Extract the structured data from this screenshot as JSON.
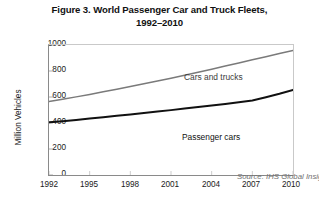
{
  "title": {
    "line1": "Figure 3. World Passenger Car and Truck Fleets,",
    "line2": "1992–2010"
  },
  "source_note": "Source: IHS Global Insight",
  "annotations": {
    "cars_and_trucks": "Cars and trucks",
    "passenger_cars": "Passenger cars"
  },
  "colors": {
    "cars_and_trucks_line": "#7a7a7a",
    "passenger_cars_line": "#111111",
    "axis": "#8a8a8a",
    "background": "#ffffff",
    "text": "#1a1a1a",
    "source_text": "#707070"
  },
  "chart_data": {
    "type": "line",
    "title": "Figure 3. World Passenger Car and Truck Fleets, 1992–2010",
    "xlabel": "",
    "ylabel": "Million Vehicles",
    "xlim": [
      1992,
      2010
    ],
    "ylim": [
      0,
      1000
    ],
    "xticks": [
      1992,
      1995,
      1998,
      2001,
      2004,
      2007,
      2010
    ],
    "yticks": [
      0,
      200,
      400,
      600,
      800,
      1000
    ],
    "grid": false,
    "legend": "inline-annotations",
    "x": [
      1992,
      1993,
      1994,
      1995,
      1996,
      1997,
      1998,
      1999,
      2000,
      2001,
      2002,
      2003,
      2004,
      2005,
      2006,
      2007,
      2008,
      2009,
      2010
    ],
    "series": [
      {
        "name": "Cars and trucks",
        "color": "#7a7a7a",
        "values": [
          565,
          583,
          601,
          620,
          640,
          660,
          681,
          702,
          723,
          745,
          768,
          791,
          814,
          838,
          862,
          886,
          910,
          935,
          958
        ]
      },
      {
        "name": "Passenger cars",
        "color": "#111111",
        "values": [
          405,
          414,
          424,
          434,
          444,
          455,
          466,
          477,
          488,
          499,
          511,
          523,
          535,
          547,
          560,
          573,
          598,
          625,
          655
        ]
      }
    ]
  }
}
